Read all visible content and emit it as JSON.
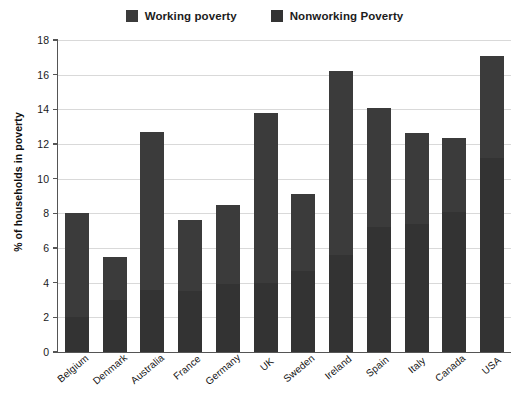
{
  "legend": {
    "entries": [
      {
        "label": "Working poverty",
        "color": "#3b3b3b",
        "icon": "legend-swatch-icon"
      },
      {
        "label": "Nonworking Poverty",
        "color": "#333333",
        "icon": "legend-swatch-icon"
      }
    ]
  },
  "axes": {
    "ylabel": "% of households in poverty",
    "yticks": [
      "0",
      "2",
      "4",
      "6",
      "8",
      "10",
      "12",
      "14",
      "16",
      "18"
    ]
  },
  "chart_data": {
    "type": "bar",
    "title": "",
    "subtitle": "",
    "xlabel": "",
    "ylabel": "% of households in poverty",
    "ylim": [
      0,
      18
    ],
    "ytick_step": 2,
    "grid": true,
    "stacked": true,
    "legend_position": "top-center",
    "categories": [
      "Belgium",
      "Denmark",
      "Australia",
      "France",
      "Germany",
      "UK",
      "Sweden",
      "Ireland",
      "Spain",
      "Italy",
      "Canada",
      "USA"
    ],
    "series": [
      {
        "name": "Nonworking Poverty",
        "color": "#333333",
        "values": [
          2.0,
          3.0,
          3.6,
          3.5,
          3.9,
          4.0,
          4.7,
          5.6,
          7.2,
          7.4,
          8.1,
          11.2
        ]
      },
      {
        "name": "Working poverty",
        "color": "#3b3b3b",
        "values": [
          6.0,
          2.5,
          9.1,
          4.1,
          4.6,
          9.8,
          4.4,
          10.6,
          6.9,
          5.25,
          4.25,
          5.9
        ]
      }
    ],
    "totals": [
      8.0,
      5.5,
      12.7,
      7.6,
      8.5,
      13.8,
      9.1,
      16.2,
      14.1,
      12.65,
      12.35,
      17.1
    ]
  }
}
